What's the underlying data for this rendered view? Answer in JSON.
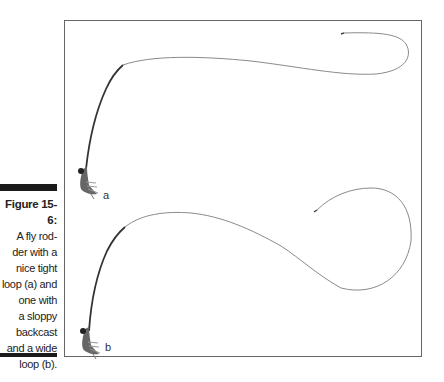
{
  "caption": {
    "title": "Figure 15-6:",
    "lines": [
      "A fly rod-",
      "der with a",
      "nice tight",
      "loop (a) and",
      "one with",
      "a sloppy",
      "backcast",
      "and a wide",
      "loop (b)."
    ]
  },
  "figure": {
    "panels": [
      {
        "label": "a",
        "description": "tight loop"
      },
      {
        "label": "b",
        "description": "wide loop with sloppy backcast"
      }
    ],
    "colors": {
      "frame": "#666666",
      "rod": "#333333",
      "line": "#888888",
      "caption_bar": "#1a1a1a"
    }
  }
}
